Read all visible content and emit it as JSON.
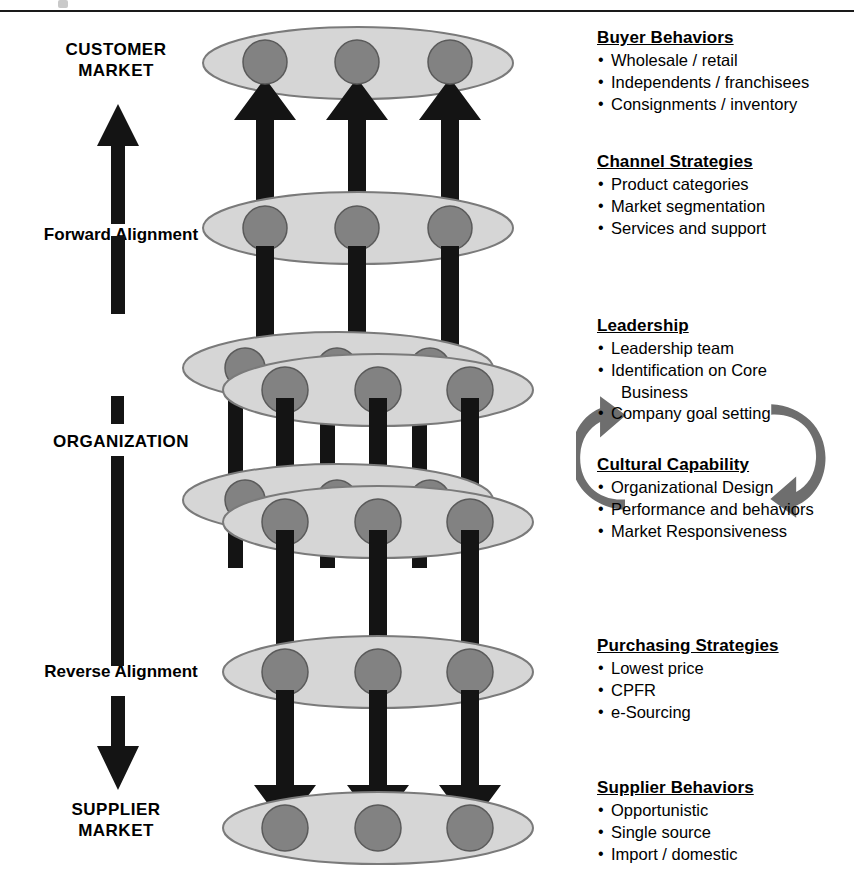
{
  "diagram": {
    "axis_labels": {
      "top": "CUSTOMER\nMARKET",
      "forward": "Forward Alignment",
      "middle": "ORGANIZATION",
      "reverse": "Reverse Alignment",
      "bottom": "SUPPLIER\nMARKET"
    },
    "icons": {
      "up_arrow": "up-arrow-icon",
      "down_arrow": "down-arrow-icon",
      "cycle_right": "cycle-arrow-right-icon",
      "cycle_left": "cycle-arrow-left-icon",
      "node": "node-circle-icon",
      "layer": "layer-ellipse-icon"
    },
    "colors": {
      "ellipse_fill": "#d6d6d6",
      "ellipse_stroke": "#7a7a7a",
      "node_fill": "#828282",
      "node_stroke": "#4d4d4d",
      "connector": "#141414",
      "cycle_arrow": "#6e6e6e",
      "rule": "#1a1a1a"
    },
    "layers": [
      {
        "name": "customer-market-layer",
        "nodes": 3
      },
      {
        "name": "channel-layer",
        "nodes": 3
      },
      {
        "name": "leadership-layer-back",
        "nodes": 3
      },
      {
        "name": "leadership-layer-front",
        "nodes": 3
      },
      {
        "name": "cultural-layer-back",
        "nodes": 3
      },
      {
        "name": "cultural-layer-front",
        "nodes": 3
      },
      {
        "name": "purchasing-layer",
        "nodes": 3
      },
      {
        "name": "supplier-market-layer",
        "nodes": 3
      }
    ]
  },
  "panels": [
    {
      "id": "buyer-behaviors",
      "heading": "Buyer Behaviors",
      "items": [
        "Wholesale / retail",
        "Independents / franchisees",
        "Consignments / inventory"
      ]
    },
    {
      "id": "channel-strategies",
      "heading": "Channel Strategies",
      "items": [
        "Product categories",
        "Market segmentation",
        "Services and support"
      ]
    },
    {
      "id": "leadership",
      "heading": "Leadership",
      "items": [
        "Leadership team",
        "Identification on Core",
        "Business",
        "Company goal setting"
      ]
    },
    {
      "id": "cultural-capability",
      "heading": "Cultural Capability",
      "items": [
        "Organizational Design",
        "Performance and behaviors",
        "Market Responsiveness"
      ]
    },
    {
      "id": "purchasing-strategies",
      "heading": "Purchasing Strategies",
      "items": [
        "Lowest price",
        "CPFR",
        "e-Sourcing"
      ]
    },
    {
      "id": "supplier-behaviors",
      "heading": "Supplier Behaviors",
      "items": [
        "Opportunistic",
        "Single source",
        "Import / domestic"
      ]
    }
  ]
}
